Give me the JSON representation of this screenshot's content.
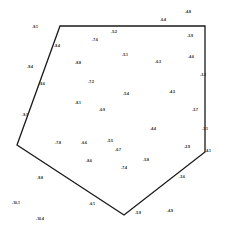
{
  "diagram": {
    "polygon": {
      "stroke": "#1a1a1a",
      "points": [
        [
          60,
          26
        ],
        [
          205,
          26
        ],
        [
          205,
          152
        ],
        [
          124,
          215
        ],
        [
          17,
          145
        ]
      ]
    },
    "labels": [
      {
        "text": "-9.1",
        "x": 35,
        "y": 27
      },
      {
        "text": "-8.4",
        "x": 57,
        "y": 46
      },
      {
        "text": "-7.6",
        "x": 95,
        "y": 40
      },
      {
        "text": "-5.2",
        "x": 114,
        "y": 32
      },
      {
        "text": "-6.4",
        "x": 163,
        "y": 20
      },
      {
        "text": "-4.8",
        "x": 188,
        "y": 12
      },
      {
        "text": "-3.9",
        "x": 190,
        "y": 36
      },
      {
        "text": "-9.4",
        "x": 30,
        "y": 67
      },
      {
        "text": "-8.8",
        "x": 78,
        "y": 63
      },
      {
        "text": "-5.1",
        "x": 125,
        "y": 55
      },
      {
        "text": "-6.3",
        "x": 158,
        "y": 62
      },
      {
        "text": "-4.6",
        "x": 191,
        "y": 57
      },
      {
        "text": "-3.2",
        "x": 203,
        "y": 75
      },
      {
        "text": "-9.6",
        "x": 42,
        "y": 84
      },
      {
        "text": "-7.2",
        "x": 91,
        "y": 82
      },
      {
        "text": "-5.4",
        "x": 126,
        "y": 94
      },
      {
        "text": "-4.3",
        "x": 172,
        "y": 92
      },
      {
        "text": "-8.1",
        "x": 78,
        "y": 103
      },
      {
        "text": "-6.9",
        "x": 102,
        "y": 110
      },
      {
        "text": "-3.7",
        "x": 195,
        "y": 110
      },
      {
        "text": "-9.3",
        "x": 25,
        "y": 115
      },
      {
        "text": "-7.8",
        "x": 58,
        "y": 143
      },
      {
        "text": "-6.6",
        "x": 84,
        "y": 143
      },
      {
        "text": "-5.5",
        "x": 110,
        "y": 141
      },
      {
        "text": "-4.4",
        "x": 153,
        "y": 129
      },
      {
        "text": "-3.1",
        "x": 205,
        "y": 129
      },
      {
        "text": "-2.9",
        "x": 187,
        "y": 147
      },
      {
        "text": "-6.7",
        "x": 118,
        "y": 150
      },
      {
        "text": "-5.8",
        "x": 146,
        "y": 160
      },
      {
        "text": "-8.6",
        "x": 89,
        "y": 161
      },
      {
        "text": "-7.4",
        "x": 124,
        "y": 168
      },
      {
        "text": "-4.1",
        "x": 208,
        "y": 151
      },
      {
        "text": "-9.8",
        "x": 40,
        "y": 178
      },
      {
        "text": "-3.6",
        "x": 182,
        "y": 177
      },
      {
        "text": "-10.1",
        "x": 16,
        "y": 203
      },
      {
        "text": "-6.1",
        "x": 92,
        "y": 204
      },
      {
        "text": "-10.4",
        "x": 40,
        "y": 219
      },
      {
        "text": "-5.9",
        "x": 138,
        "y": 213
      },
      {
        "text": "-4.9",
        "x": 170,
        "y": 211
      }
    ]
  }
}
